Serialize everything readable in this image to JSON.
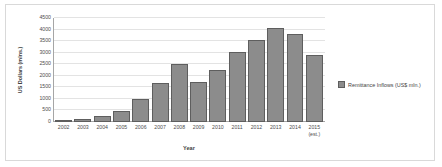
{
  "chart_data": {
    "type": "bar",
    "title": "",
    "xlabel": "Year",
    "ylabel": "US Dollars (mlns.)",
    "categories": [
      "2002",
      "2003",
      "2004",
      "2005",
      "2006",
      "2007",
      "2008",
      "2009",
      "2010",
      "2011",
      "2012",
      "2013",
      "2014",
      "2015\n(est.)"
    ],
    "values": [
      70,
      150,
      250,
      460,
      1000,
      1670,
      2520,
      1720,
      2270,
      3020,
      3560,
      4080,
      3790,
      2910
    ],
    "series": [
      {
        "name": "Remittance Inflows (US$ mln.)",
        "values": [
          70,
          150,
          250,
          460,
          1000,
          1670,
          2520,
          1720,
          2270,
          3020,
          3560,
          4080,
          3790,
          2910
        ]
      }
    ],
    "ylim": [
      0,
      4500
    ],
    "ytick_step": 500,
    "yticks": [
      0,
      500,
      1000,
      1500,
      2000,
      2500,
      3000,
      3500,
      4000,
      4500
    ],
    "ytick_labels": [
      "0",
      "500",
      "1000",
      "1500",
      "2000",
      "2500",
      "3000",
      "3500",
      "4000",
      "4500"
    ],
    "grid": true,
    "legend_position": "right",
    "legend": [
      "Remittance Inflows (US$ mln.)"
    ],
    "colors": {
      "bar_fill": "#8c8c8c",
      "bar_border": "#5e5e5e",
      "gridline": "#e3e3e3",
      "axis": "#a6a6a6",
      "text": "#4d4d4d",
      "frame_border": "#d9d9d9",
      "background": "#ffffff"
    }
  },
  "legend": {
    "swatch_name": "legend-color-swatch",
    "label": "Remittance Inflows (US$ mln.)"
  },
  "axes": {
    "x_title": "Year",
    "y_title": "US Dollars (mlns.)"
  }
}
